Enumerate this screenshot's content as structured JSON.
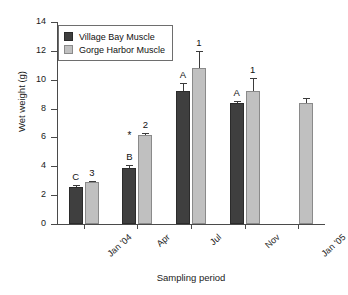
{
  "chart_data": {
    "type": "bar",
    "title": "",
    "xlabel": "Sampling period",
    "ylabel": "Wet weight (g)",
    "categories": [
      "Jan '04",
      "Apr",
      "Jul",
      "Nov",
      "Jan '05"
    ],
    "ylim": [
      0,
      14
    ],
    "yticks": [
      0,
      2,
      4,
      6,
      8,
      10,
      12,
      14
    ],
    "ytick_labels": [
      "0",
      "2",
      "4",
      "6",
      "8",
      "10",
      "12",
      "14"
    ],
    "grid": false,
    "legend_position": "upper left",
    "series": [
      {
        "name": "Village Bay Muscle",
        "color": "#3f3f3f",
        "values": [
          2.55,
          3.9,
          9.25,
          8.4,
          null
        ],
        "errors": [
          0.12,
          0.22,
          0.55,
          0.1,
          null
        ],
        "annotations": [
          "C",
          "B",
          "A",
          "A",
          ""
        ]
      },
      {
        "name": "Gorge Harbor Muscle",
        "color": "#c0c0c0",
        "values": [
          2.9,
          6.15,
          10.8,
          9.25,
          8.4
        ],
        "errors": [
          0.1,
          0.18,
          1.2,
          0.85,
          0.3
        ],
        "annotations": [
          "3",
          "2",
          "1",
          "1",
          ""
        ]
      }
    ],
    "markers": [
      {
        "series": 0,
        "category_index": 1,
        "symbol": "*",
        "meaning": "significance-marker"
      }
    ]
  },
  "legend": {
    "entries": [
      {
        "label": "Village Bay Muscle"
      },
      {
        "label": "Gorge Harbor Muscle"
      }
    ]
  }
}
